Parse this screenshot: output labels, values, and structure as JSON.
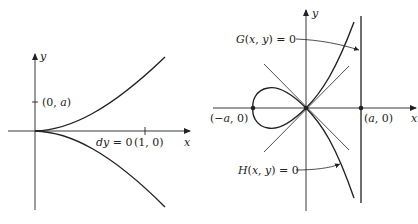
{
  "left_figure": {
    "axis_x_label": "x",
    "axis_y_label": "y",
    "point_0a": "(0, a)",
    "point_10": "(1, 0)",
    "annotation": "dy = 0"
  },
  "right_figure": {
    "axis_x_label": "x",
    "axis_y_label": "y",
    "point_neg_a0": "(−a, 0)",
    "point_a0": "(a, 0)",
    "label_G": "G(x, y) = 0",
    "label_H": "H(x, y) = 0"
  },
  "colors": {
    "ink": "#222222",
    "background": "#ffffff"
  }
}
